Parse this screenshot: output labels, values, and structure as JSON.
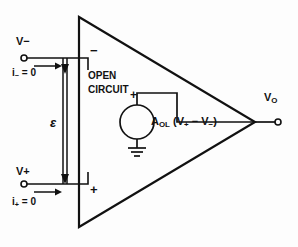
{
  "figure": {
    "type": "circuit-schematic",
    "background_color": "#fdfdfd",
    "line_color": "#111111"
  },
  "terminals": {
    "inverting": {
      "voltage_label": "V",
      "voltage_sign": "−",
      "current_label": "i",
      "current_sub": "−",
      "current_value": "= 0",
      "polarity_sign": "−"
    },
    "noninverting": {
      "voltage_label": "V",
      "voltage_sign": "+",
      "current_label": "i",
      "current_sub": "+",
      "current_value": "= 0",
      "polarity_sign": "+"
    },
    "output": {
      "label": "V",
      "sub": "O"
    }
  },
  "annotations": {
    "open_line1": "OPEN",
    "open_line2": "CIRCUIT",
    "differential_voltage": "ε"
  },
  "source": {
    "polarity_sign": "+",
    "gain_symbol": "A",
    "gain_sub": "OL",
    "expression": "(V",
    "expr_plus": "+",
    "expr_minus": "− V",
    "expr_minus_sub": "−",
    "expr_close": ")",
    "ground": "ground-symbol"
  }
}
